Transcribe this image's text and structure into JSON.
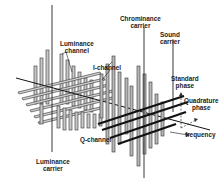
{
  "diagram": {
    "title": "",
    "labels": {
      "chrominance_carrier": [
        "Chrominance",
        "carrier"
      ],
      "sound_carrier": [
        "Sound",
        "carrier"
      ],
      "luminance_channel": [
        "Luminance",
        "channel"
      ],
      "i_channel": "I-channel",
      "standard_phase": [
        "Standard",
        "phase"
      ],
      "quadrature_phase": [
        "Quadrature",
        "phase"
      ],
      "frequency": "frequency",
      "q_channel": "Q-channel",
      "luminance_carrier": [
        "Luminance",
        "carrier"
      ]
    },
    "colors": {
      "line": "#222222",
      "bar_fill": "#bdbdbd",
      "bar_stroke": "#333333",
      "background": "#ffffff"
    }
  }
}
